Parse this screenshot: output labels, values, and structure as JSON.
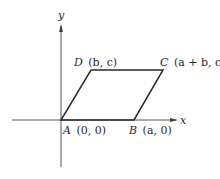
{
  "diagram": {
    "axes": {
      "x_label": "x",
      "y_label": "y"
    },
    "points": [
      {
        "name": "A",
        "coords": "(0, 0)",
        "px": [
          61,
          120
        ]
      },
      {
        "name": "B",
        "coords": "(a, 0)",
        "px": [
          134,
          120
        ]
      },
      {
        "name": "C",
        "coords": "(a + b, c)",
        "px": [
          163,
          70
        ]
      },
      {
        "name": "D",
        "coords": "(b, c)",
        "px": [
          91,
          70
        ]
      }
    ],
    "shape": "parallelogram ABCD",
    "colors": {
      "line": "#2a2a2a",
      "axis": "#555555",
      "background": "#ffffff"
    }
  }
}
